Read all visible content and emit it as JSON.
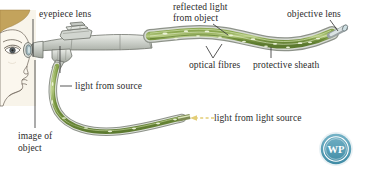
{
  "figure": {
    "type": "diagram",
    "background_color": "#ffffff"
  },
  "labels": {
    "eyepiece_lens": "eyepiece lens",
    "reflected_light_line1": "reflected light",
    "reflected_light_line2": "from object",
    "objective_lens": "objective lens",
    "optical_fibres": "optical fibres",
    "protective_sheath": "protective sheath",
    "light_from_source": "light from source",
    "image_of_object_line1": "image of",
    "image_of_object_line2": "object",
    "light_from_light_source": "light from light source"
  },
  "watermark": {
    "text": "WP",
    "color": "#5a9fb8",
    "shape": "circular-badge"
  },
  "colors": {
    "fibre_green": "#6e8c3a",
    "fibre_green_light": "#a8bf72",
    "sheath_grey": "#b9bdb8",
    "body_grey": "#c9cdc8",
    "skin": "#f6f0e4",
    "hair": "#bfa058",
    "outline": "#55514a",
    "arrow_yellow": "#e8d27a",
    "leader_line": "#3a3a3a",
    "text": "#2b2b2b"
  }
}
